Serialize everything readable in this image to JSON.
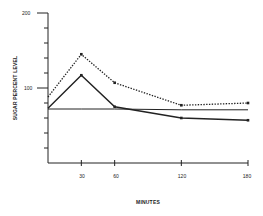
{
  "chart_data": {
    "type": "line",
    "title": "",
    "xlabel": "MINUTES",
    "ylabel": "SUGAR PERCENT LEVEL",
    "xlim": [
      0,
      180
    ],
    "ylim": [
      0,
      200
    ],
    "x_ticks": [
      30,
      60,
      120,
      180
    ],
    "x_tick_labels": [
      "30",
      "60",
      "120",
      "180"
    ],
    "y_ticks": [
      0,
      20,
      40,
      60,
      80,
      100,
      120,
      140,
      160,
      180,
      200
    ],
    "y_tick_labels_shown": [
      "100",
      "200"
    ],
    "grid": false,
    "legend": null,
    "x": [
      0,
      30,
      60,
      120,
      180
    ],
    "series": [
      {
        "name": "dotted",
        "style": "dotted",
        "markers": true,
        "values": [
          88,
          145,
          107,
          77,
          80
        ]
      },
      {
        "name": "solid",
        "style": "solid",
        "markers": true,
        "values": [
          73,
          117,
          75,
          60,
          57
        ]
      },
      {
        "name": "baseline",
        "style": "solid",
        "markers": false,
        "values": [
          72,
          72,
          72,
          71,
          71
        ]
      }
    ]
  },
  "labels": {
    "y_200": "200",
    "y_100": "100",
    "x_30": "30",
    "x_60": "60",
    "x_120": "120",
    "x_180": "180",
    "xlabel": "MINUTES",
    "ylabel": "SUGAR PERCENT LEVEL"
  },
  "colors": {
    "ink": "#222222",
    "background": "#ffffff"
  }
}
